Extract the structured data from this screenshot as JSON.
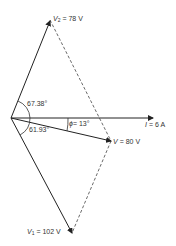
{
  "diagram": {
    "type": "phasor-diagram",
    "phasors": [
      {
        "id": "V2",
        "symbol": "V",
        "subscript": "2",
        "value": "= 78 V"
      },
      {
        "id": "I",
        "symbol": "I",
        "subscript": "",
        "value": "= 6 A"
      },
      {
        "id": "V",
        "symbol": "V",
        "subscript": "",
        "value": "= 80 V"
      },
      {
        "id": "V1",
        "symbol": "V",
        "subscript": "1",
        "value": "= 102 V"
      }
    ],
    "angles": {
      "v2_angle": "67.38°",
      "v1_angle": "61.93°",
      "phi_symbol": "ϕ",
      "phi_value": "= 13°"
    }
  }
}
